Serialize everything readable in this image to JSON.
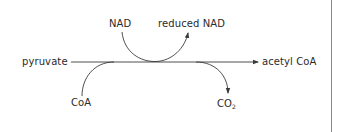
{
  "diagram": {
    "type": "reaction-pathway",
    "main_reaction": {
      "reactant": "pyruvate",
      "product": "acetyl CoA"
    },
    "side_inputs": [
      {
        "label": "NAD"
      },
      {
        "label": "CoA"
      }
    ],
    "side_outputs": [
      {
        "label": "reduced NAD"
      },
      {
        "label": "CO",
        "subscript": "2"
      }
    ],
    "colors": {
      "line": "#3a3a3a",
      "text": "#2b2b2b",
      "border": "#8a8a8a"
    }
  }
}
